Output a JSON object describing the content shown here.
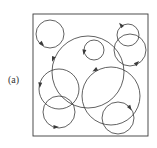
{
  "figure": {
    "label": "(a)",
    "frame": {
      "x": 33,
      "y": 14,
      "width": 115,
      "height": 122
    },
    "stroke_color": "#3a3a3a",
    "circles": [
      {
        "id": "A",
        "cx": 50,
        "cy": 34,
        "r": 14,
        "arrow": {
          "x": 42,
          "y": 44,
          "angle": 45
        }
      },
      {
        "id": "B",
        "cx": 88,
        "cy": 72,
        "r": 36,
        "arrow": {
          "x": 53,
          "y": 59,
          "angle": 110
        }
      },
      {
        "id": "C",
        "cx": 94,
        "cy": 50,
        "r": 10,
        "arrow": {
          "x": 84,
          "y": 52,
          "angle": 100
        }
      },
      {
        "id": "D",
        "cx": 128,
        "cy": 35,
        "r": 11,
        "arrow": {
          "x": 121,
          "y": 25,
          "angle": 230
        }
      },
      {
        "id": "E",
        "cx": 130,
        "cy": 50,
        "r": 16,
        "arrow": {
          "x": 137,
          "y": 63,
          "angle": 315
        }
      },
      {
        "id": "F",
        "cx": 59,
        "cy": 89,
        "r": 20,
        "arrow": {
          "x": 40,
          "y": 85,
          "angle": 95
        }
      },
      {
        "id": "G",
        "cx": 59,
        "cy": 112,
        "r": 16,
        "arrow": {
          "x": 56,
          "y": 127,
          "angle": 0
        }
      },
      {
        "id": "H",
        "cx": 111,
        "cy": 96,
        "r": 29,
        "arrow": {
          "x": 95,
          "y": 70,
          "angle": 150
        }
      },
      {
        "id": "I",
        "cx": 118,
        "cy": 118,
        "r": 16,
        "arrow": {
          "x": 130,
          "y": 108,
          "angle": 55
        }
      }
    ]
  }
}
